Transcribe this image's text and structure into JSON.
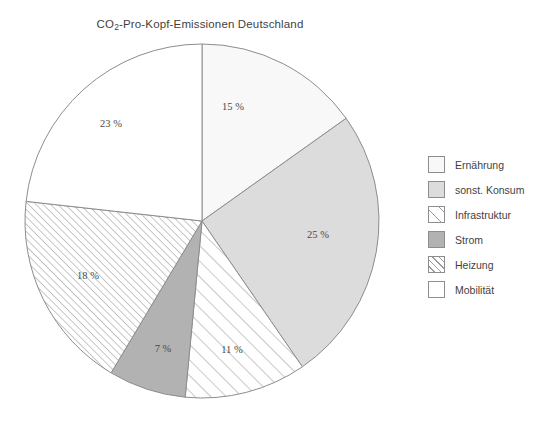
{
  "chart_data": {
    "type": "pie",
    "title_main": "CO",
    "title_sub": "2",
    "title_rest": "-Pro-Kopf-Emissionen Deutschland",
    "xlabel": "",
    "ylabel": "",
    "unit": "%",
    "legend_position": "right",
    "grid": false,
    "start_angle_deg": 0,
    "direction": "clockwise",
    "categories": [
      "Ernährung",
      "sonst. Konsum",
      "Infrastruktur",
      "Strom",
      "Heizung",
      "Mobilität"
    ],
    "values": [
      15,
      25,
      11,
      7,
      18,
      23
    ],
    "labels": [
      "15 %",
      "25 %",
      "11 %",
      "7 %",
      "18 %",
      "23 %"
    ],
    "slices": [
      {
        "name": "Ernährung",
        "value": 15,
        "label": "15 %",
        "fill": "#f8f8f8",
        "pattern": "solid",
        "label_x": 233,
        "label_y": 110
      },
      {
        "name": "sonst. Konsum",
        "value": 25,
        "label": "25 %",
        "fill": "#dcdcdc",
        "pattern": "solid",
        "label_x": 318,
        "label_y": 238
      },
      {
        "name": "Infrastruktur",
        "value": 11,
        "label": "11 %",
        "fill": "#ffffff",
        "pattern": "hatch-sparse",
        "label_x": 232,
        "label_y": 353
      },
      {
        "name": "Strom",
        "value": 7,
        "label": "7 %",
        "fill": "#b2b2b2",
        "pattern": "solid",
        "label_x": 163,
        "label_y": 352
      },
      {
        "name": "Heizung",
        "value": 18,
        "label": "18 %",
        "fill": "#ffffff",
        "pattern": "hatch-dense",
        "label_x": 88,
        "label_y": 279
      },
      {
        "name": "Mobilität",
        "value": 23,
        "label": "23 %",
        "fill": "#ffffff",
        "pattern": "solid",
        "label_x": 111,
        "label_y": 127
      }
    ],
    "colors": {
      "outline": "#8d8d8d",
      "hatch": "#9a9a9a",
      "text": "#3f3f3f"
    },
    "geometry": {
      "cx": 202,
      "cy": 221,
      "r": 177
    }
  },
  "legend": {
    "items": [
      {
        "label": "Ernährung",
        "swatch": "solid-0"
      },
      {
        "label": "sonst. Konsum",
        "swatch": "solid-1"
      },
      {
        "label": "Infrastruktur",
        "swatch": "hatch-sparse"
      },
      {
        "label": "Strom",
        "swatch": "solid-3"
      },
      {
        "label": "Heizung",
        "swatch": "hatch-dense"
      },
      {
        "label": "Mobilität",
        "swatch": "solid-5"
      }
    ]
  }
}
